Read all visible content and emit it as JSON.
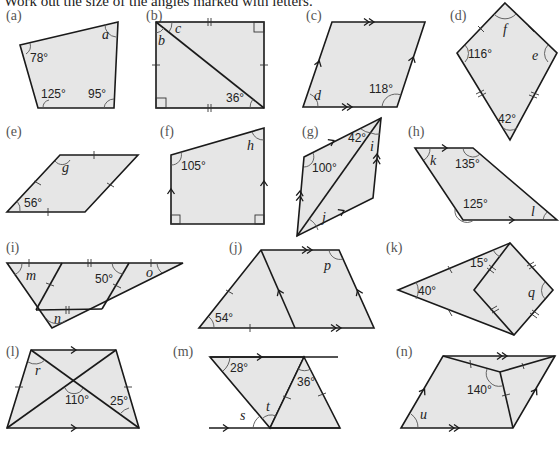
{
  "instruction": "Work out the size of the angles marked with letters.",
  "problems": [
    {
      "id": "a",
      "label": "(a)",
      "shape": "quadrilateral",
      "given_angles": [
        "78°",
        "125°",
        "95°"
      ],
      "unknowns": [
        "a"
      ]
    },
    {
      "id": "b",
      "label": "(b)",
      "shape": "rectangle with diagonal",
      "given_angles": [
        "36°"
      ],
      "unknowns": [
        "b",
        "c"
      ]
    },
    {
      "id": "c",
      "label": "(c)",
      "shape": "parallelogram",
      "given_angles": [
        "118°"
      ],
      "unknowns": [
        "d"
      ]
    },
    {
      "id": "d",
      "label": "(d)",
      "shape": "kite",
      "given_angles": [
        "116°",
        "42°"
      ],
      "unknowns": [
        "f",
        "e"
      ]
    },
    {
      "id": "e",
      "label": "(e)",
      "shape": "rhombus",
      "given_angles": [
        "56°"
      ],
      "unknowns": [
        "g"
      ]
    },
    {
      "id": "f",
      "label": "(f)",
      "shape": "right trapezium",
      "given_angles": [
        "105°"
      ],
      "unknowns": [
        "h"
      ]
    },
    {
      "id": "g",
      "label": "(g)",
      "shape": "parallelogram with diagonal",
      "given_angles": [
        "42°",
        "100°"
      ],
      "unknowns": [
        "i",
        "j"
      ]
    },
    {
      "id": "h",
      "label": "(h)",
      "shape": "trapezium",
      "given_angles": [
        "135°",
        "125°"
      ],
      "unknowns": [
        "k",
        "l"
      ]
    },
    {
      "id": "i",
      "label": "(i)",
      "shape": "triangle divided into rhombuses",
      "given_angles": [
        "50°"
      ],
      "unknowns": [
        "m",
        "o",
        "n"
      ]
    },
    {
      "id": "j",
      "label": "(j)",
      "shape": "trapezium with rhombus",
      "given_angles": [
        "54°"
      ],
      "unknowns": [
        "p"
      ]
    },
    {
      "id": "k",
      "label": "(k)",
      "shape": "isosceles triangle with rhombus",
      "given_angles": [
        "15°",
        "40°"
      ],
      "unknowns": [
        "q"
      ]
    },
    {
      "id": "l",
      "label": "(l)",
      "shape": "isosceles trapezium with diagonals",
      "given_angles": [
        "110°",
        "25°"
      ],
      "unknowns": [
        "r"
      ]
    },
    {
      "id": "m",
      "label": "(m)",
      "shape": "parallel lines with triangles",
      "given_angles": [
        "28°",
        "36°"
      ],
      "unknowns": [
        "s",
        "t"
      ]
    },
    {
      "id": "n",
      "label": "(n)",
      "shape": "parallelogram with kite",
      "given_angles": [
        "140°"
      ],
      "unknowns": [
        "u"
      ]
    }
  ]
}
